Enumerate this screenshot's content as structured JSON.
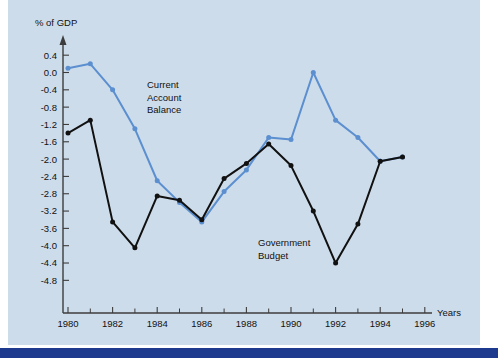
{
  "figure": {
    "background_plate_color": "#cddcea",
    "page_color": "#ffffff",
    "bottom_rule_color": "#1d3a8f"
  },
  "chart_data": {
    "type": "line",
    "title": "",
    "ylabel": "% of GDP",
    "xlabel": "Years",
    "grid": false,
    "legend": "inline-annotations",
    "xlim": [
      1979.4,
      1996.8
    ],
    "ylim": [
      -5.0,
      0.6
    ],
    "x_tick_labels": [
      "1980",
      "1982",
      "1984",
      "1986",
      "1988",
      "1990",
      "1992",
      "1994",
      "1996"
    ],
    "x_tick_values": [
      1980,
      1982,
      1984,
      1986,
      1988,
      1990,
      1992,
      1994,
      1996
    ],
    "x_minor_ticks": [
      1981,
      1983,
      1985,
      1987,
      1989,
      1991,
      1993,
      1995
    ],
    "y_tick_labels": [
      "0.4",
      "0.0",
      "-0.4",
      "-0.8",
      "-1.2",
      "-1.6",
      "-2.0",
      "-2.4",
      "-2.8",
      "-3.2",
      "-3.6",
      "-4.0",
      "-4.4",
      "-4.8"
    ],
    "y_tick_values": [
      0.4,
      0.0,
      -0.4,
      -0.8,
      -1.2,
      -1.6,
      -2.0,
      -2.4,
      -2.8,
      -3.2,
      -3.6,
      -4.0,
      -4.4,
      -4.8
    ],
    "series": [
      {
        "name": "Current Account Balance",
        "color": "#5b8fd0",
        "marker": "circle",
        "x": [
          1980,
          1981,
          1982,
          1983,
          1984,
          1985,
          1986,
          1987,
          1988,
          1989,
          1990,
          1991,
          1992,
          1993,
          1994,
          1995
        ],
        "values": [
          0.1,
          0.2,
          -0.4,
          -1.3,
          -2.5,
          -3.0,
          -3.45,
          -2.75,
          -2.25,
          -1.5,
          -1.55,
          0.0,
          -1.1,
          -1.5,
          -2.05,
          -1.95
        ]
      },
      {
        "name": "Government Budget",
        "color": "#111111",
        "marker": "circle",
        "x": [
          1980,
          1981,
          1982,
          1983,
          1984,
          1985,
          1986,
          1987,
          1988,
          1989,
          1990,
          1991,
          1992,
          1993,
          1994,
          1995
        ],
        "values": [
          -1.4,
          -1.1,
          -3.45,
          -4.05,
          -2.85,
          -2.95,
          -3.4,
          -2.45,
          -2.1,
          -1.65,
          -2.15,
          -3.2,
          -4.4,
          -3.5,
          -2.05,
          -1.95
        ]
      }
    ],
    "annotations": [
      {
        "id": "current-account-balance",
        "lines": [
          "Current",
          "Account",
          "Balance"
        ],
        "x_px": 147,
        "y_px": 88,
        "color": "#111111"
      },
      {
        "id": "government-budget",
        "lines": [
          "Government",
          "Budget"
        ],
        "x_px": 258,
        "y_px": 246,
        "color": "#111111"
      }
    ]
  }
}
